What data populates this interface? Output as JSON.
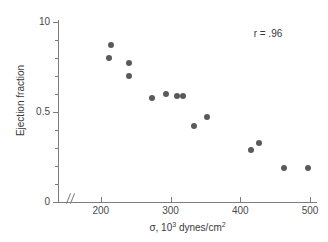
{
  "chart_data": {
    "type": "scatter",
    "title": "",
    "xlabel": "σ, 10³ dynes/cm²",
    "xlabel_base": "σ, 10",
    "xlabel_exp1": "3",
    "xlabel_mid": " dynes/cm",
    "xlabel_exp2": "2",
    "ylabel": "Ejection fraction",
    "xlim": [
      140,
      510
    ],
    "ylim": [
      0,
      1.0
    ],
    "grid": false,
    "legend": null,
    "axis_break_x": true,
    "annotations": [
      {
        "text": "r = .96",
        "x": 455,
        "y": 0.94
      }
    ],
    "xticks": [
      200,
      300,
      400,
      500
    ],
    "xticklabels": [
      "200",
      "300",
      "400",
      "500"
    ],
    "yticks": [
      0,
      0.5,
      1.0
    ],
    "yticklabels": [
      "0",
      "0.5",
      "10"
    ],
    "yminorticks": [
      0.1,
      0.2,
      0.3,
      0.4,
      0.6,
      0.7,
      0.8,
      0.9
    ],
    "marker": {
      "shape": "circle",
      "color": "#5a5a5a",
      "size_px": 6
    },
    "points": [
      {
        "x": 214,
        "y": 0.87
      },
      {
        "x": 211,
        "y": 0.8
      },
      {
        "x": 240,
        "y": 0.77
      },
      {
        "x": 241,
        "y": 0.7
      },
      {
        "x": 274,
        "y": 0.58
      },
      {
        "x": 293,
        "y": 0.6
      },
      {
        "x": 309,
        "y": 0.59
      },
      {
        "x": 318,
        "y": 0.59
      },
      {
        "x": 333,
        "y": 0.42
      },
      {
        "x": 352,
        "y": 0.47
      },
      {
        "x": 415,
        "y": 0.29
      },
      {
        "x": 427,
        "y": 0.33
      },
      {
        "x": 462,
        "y": 0.19
      },
      {
        "x": 497,
        "y": 0.19
      }
    ],
    "colors": {
      "axis": "#7d7d7d",
      "text": "#3a3a3a",
      "marker": "#5a5a5a",
      "background": "#ffffff"
    }
  }
}
